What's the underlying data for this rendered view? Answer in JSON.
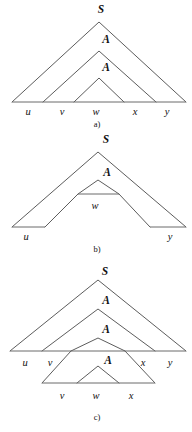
{
  "figure": {
    "name": "pumping-lemma-parse-trees",
    "panels": [
      {
        "id": "a",
        "caption": "a)",
        "caption_x": 97,
        "caption_y": 120,
        "nonterminals": [
          {
            "label": "S",
            "x": 101,
            "y": 13
          },
          {
            "label": "A",
            "x": 106,
            "y": 43
          },
          {
            "label": "A",
            "x": 106,
            "y": 71
          }
        ],
        "terminals": [
          {
            "label": "u",
            "x": 28,
            "y": 115
          },
          {
            "label": "v",
            "x": 62,
            "y": 115
          },
          {
            "label": "w",
            "x": 96,
            "y": 115
          },
          {
            "label": "x",
            "x": 135,
            "y": 115
          },
          {
            "label": "y",
            "x": 167,
            "y": 115
          }
        ],
        "triangles": [
          {
            "name": "outer-triangle-S",
            "apex_x": 99,
            "apex_y": 22,
            "left_x": 12,
            "right_x": 186,
            "base_y": 102
          },
          {
            "name": "middle-triangle-A",
            "apex_x": 99,
            "apex_y": 51,
            "left_x": 43,
            "right_x": 156,
            "base_y": 102
          },
          {
            "name": "inner-triangle-A",
            "apex_x": 99,
            "apex_y": 78,
            "left_x": 74,
            "right_x": 124,
            "base_y": 102
          }
        ],
        "baseline": {
          "x1": 12,
          "x2": 186,
          "y": 102
        }
      },
      {
        "id": "b",
        "caption": "b)",
        "caption_x": 97,
        "caption_y": 248,
        "nonterminals": [
          {
            "label": "S",
            "x": 106,
            "y": 143
          },
          {
            "label": "A",
            "x": 107,
            "y": 172
          }
        ],
        "terminals": [
          {
            "label": "u",
            "x": 26,
            "y": 240
          },
          {
            "label": "w",
            "x": 95,
            "y": 208
          },
          {
            "label": "y",
            "x": 170,
            "y": 240
          }
        ],
        "triangles": [
          {
            "name": "outer-triangle-S",
            "apex_x": 98,
            "apex_y": 152,
            "left_x": 12,
            "right_x": 186,
            "base_y": 227
          },
          {
            "name": "inner-triangle-A",
            "apex_x": 98,
            "apex_y": 180,
            "left_x": 78,
            "right_x": 119,
            "base_y": 194
          }
        ],
        "segments": [
          {
            "name": "u-baseline",
            "x1": 12,
            "x2": 45,
            "y": 227
          },
          {
            "name": "y-baseline",
            "x1": 150,
            "x2": 186,
            "y": 227
          },
          {
            "name": "w-baseline",
            "x1": 78,
            "x2": 119,
            "y": 194
          }
        ]
      },
      {
        "id": "c",
        "caption": "c)",
        "caption_x": 97,
        "caption_y": 417,
        "nonterminals": [
          {
            "label": "S",
            "x": 105,
            "y": 272
          },
          {
            "label": "A",
            "x": 106,
            "y": 301
          },
          {
            "label": "A",
            "x": 106,
            "y": 330
          },
          {
            "label": "A",
            "x": 106,
            "y": 362
          }
        ],
        "terminals_upper": [
          {
            "label": "u",
            "x": 25,
            "y": 365
          },
          {
            "label": "v",
            "x": 50,
            "y": 365
          },
          {
            "label": "x",
            "x": 143,
            "y": 365
          },
          {
            "label": "y",
            "x": 170,
            "y": 365
          }
        ],
        "terminals_lower": [
          {
            "label": "v",
            "x": 62,
            "y": 399
          },
          {
            "label": "w",
            "x": 96,
            "y": 399
          },
          {
            "label": "x",
            "x": 131,
            "y": 399
          }
        ],
        "triangles": [
          {
            "name": "outer-triangle-S",
            "apex_x": 98,
            "apex_y": 280,
            "left_x": 10,
            "right_x": 186,
            "base_y": 351
          },
          {
            "name": "second-triangle-A",
            "apex_x": 98,
            "apex_y": 309,
            "left_x": 42,
            "right_x": 155,
            "base_y": 351
          },
          {
            "name": "third-triangle-A",
            "apex_x": 98,
            "apex_y": 338,
            "left_x": 71,
            "right_x": 125,
            "base_y": 351
          },
          {
            "name": "fourth-triangle-A",
            "apex_x": 98,
            "apex_y": 366,
            "left_x": 77,
            "right_x": 119,
            "base_y": 383
          }
        ],
        "extended_edges": [
          {
            "name": "left-extension",
            "x1": 71,
            "y1": 351,
            "x2": 42,
            "y2": 383
          },
          {
            "name": "right-extension",
            "x1": 125,
            "y1": 351,
            "x2": 155,
            "y2": 383
          }
        ],
        "baselines": [
          {
            "name": "main-baseline",
            "x1": 10,
            "x2": 186,
            "y": 351
          },
          {
            "name": "lower-baseline",
            "x1": 42,
            "x2": 155,
            "y": 383
          }
        ]
      }
    ]
  }
}
